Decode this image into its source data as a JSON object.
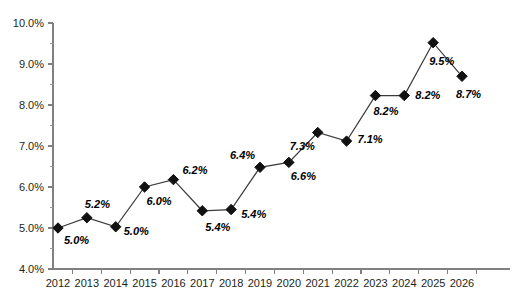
{
  "chart_data": {
    "type": "line",
    "title": "",
    "subtitle": "",
    "xlabel": "",
    "ylabel": "",
    "categories": [
      "2012",
      "2013",
      "2014",
      "2015",
      "2016",
      "2017",
      "2018",
      "2019",
      "2020",
      "2021",
      "2022",
      "2023",
      "2024",
      "2025",
      "2026"
    ],
    "values": [
      5.0,
      5.2,
      5.0,
      6.0,
      6.2,
      5.4,
      5.4,
      6.4,
      6.6,
      7.3,
      7.1,
      8.2,
      8.2,
      9.5,
      8.7
    ],
    "point_labels": [
      "5.0%",
      "5.2%",
      "5.0%",
      "6.0%",
      "6.2%",
      "5.4%",
      "5.4%",
      "6.4%",
      "6.6%",
      "7.3%",
      "7.1%",
      "8.2%",
      "8.2%",
      "9.5%",
      "8.7%"
    ],
    "marker_values": [
      5.0,
      5.25,
      5.03,
      6.0,
      6.18,
      5.42,
      5.45,
      6.48,
      6.6,
      7.33,
      7.12,
      8.23,
      8.23,
      9.52,
      8.7
    ],
    "ylim": [
      4.0,
      10.0
    ],
    "ytick_labels": [
      "10.0%",
      "9.0%",
      "8.0%",
      "7.0%",
      "6.0%",
      "5.0%",
      "4.0%"
    ],
    "ytick_values": [
      10.0,
      9.0,
      8.0,
      7.0,
      6.0,
      5.0,
      4.0
    ],
    "yminor_values": [
      9.5,
      8.5,
      7.5,
      6.5,
      5.5,
      4.5
    ],
    "grid": false,
    "legend": false,
    "legend_position": "none",
    "series": [
      {
        "name": "",
        "values": [
          5.0,
          5.2,
          5.0,
          6.0,
          6.2,
          5.4,
          5.4,
          6.4,
          6.6,
          7.3,
          7.1,
          8.2,
          8.2,
          9.5,
          8.7
        ],
        "marker": "diamond",
        "color": "#111111"
      }
    ],
    "label_offsets": [
      {
        "dx": 6,
        "dy": 16
      },
      {
        "dx": -2,
        "dy": -10
      },
      {
        "dx": 8,
        "dy": 8
      },
      {
        "dx": 2,
        "dy": 18
      },
      {
        "dx": 9,
        "dy": -6
      },
      {
        "dx": 3,
        "dy": 20
      },
      {
        "dx": 10,
        "dy": 8
      },
      {
        "dx": -30,
        "dy": -8
      },
      {
        "dx": 2,
        "dy": 18
      },
      {
        "dx": -28,
        "dy": 18
      },
      {
        "dx": 11,
        "dy": 2
      },
      {
        "dx": -2,
        "dy": 19
      },
      {
        "dx": 11,
        "dy": 3
      },
      {
        "dx": -4,
        "dy": 22
      },
      {
        "dx": -6,
        "dy": 22
      }
    ]
  },
  "colors": {
    "background": "#ffffff",
    "axis": "#808080",
    "line": "#3b3b3b",
    "marker": "#111111",
    "text": "#231f20"
  }
}
